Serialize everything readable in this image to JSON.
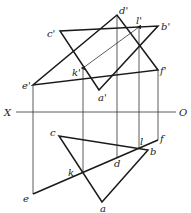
{
  "diagram": {
    "type": "descriptive-geometry-projection",
    "axis": {
      "left_label": "X",
      "right_label": "O",
      "y": 112,
      "x1": 16,
      "x2": 176
    },
    "front_view": {
      "points": {
        "a": {
          "label": "a'",
          "x": 99,
          "y": 90
        },
        "b": {
          "label": "b'",
          "x": 158,
          "y": 26
        },
        "c": {
          "label": "c'",
          "x": 60,
          "y": 31
        },
        "d": {
          "label": "d'",
          "x": 117,
          "y": 15
        },
        "e": {
          "label": "e'",
          "x": 33,
          "y": 85
        },
        "f": {
          "label": "f'",
          "x": 158,
          "y": 70
        },
        "k": {
          "label": "k'",
          "x": 83,
          "y": 68
        },
        "l": {
          "label": "l'",
          "x": 139,
          "y": 27
        }
      }
    },
    "top_view": {
      "points": {
        "a": {
          "label": "a",
          "x": 102,
          "y": 202
        },
        "b": {
          "label": "b",
          "x": 148,
          "y": 150
        },
        "c": {
          "label": "c",
          "x": 59,
          "y": 136
        },
        "d": {
          "label": "d",
          "x": 117,
          "y": 158
        },
        "e": {
          "label": "e",
          "x": 33,
          "y": 194
        },
        "f": {
          "label": "f",
          "x": 158,
          "y": 140
        },
        "k": {
          "label": "k",
          "x": 83,
          "y": 173
        },
        "l": {
          "label": "l",
          "x": 139,
          "y": 148
        }
      }
    }
  }
}
